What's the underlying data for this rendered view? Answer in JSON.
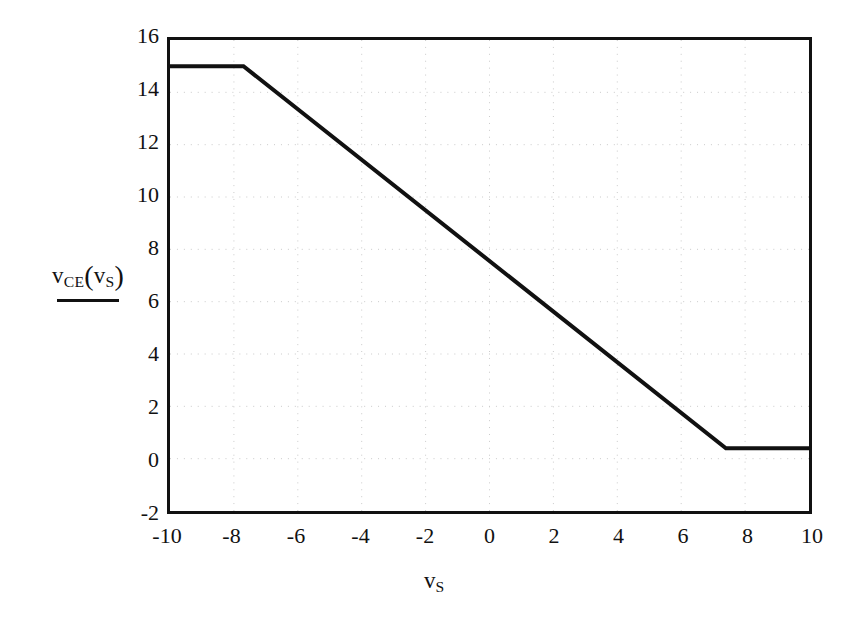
{
  "chart_data": {
    "type": "line",
    "title": "",
    "subtitle": "",
    "xlabel": "v_S",
    "ylabel": "v_CE(v_S)",
    "xlabel_base": "v",
    "xlabel_sub": "S",
    "ylabel_base": "v",
    "ylabel_sub": "CE",
    "ylabel_arg_base": "v",
    "ylabel_arg_sub": "S",
    "xlim": [
      -10,
      10
    ],
    "ylim": [
      -2,
      16
    ],
    "xticks": [
      -10,
      -8,
      -6,
      -4,
      -2,
      0,
      2,
      4,
      6,
      8,
      10
    ],
    "xtick_labels": [
      "-10",
      "-8",
      "-6",
      "-4",
      "-2",
      "0",
      "2",
      "4",
      "6",
      "8",
      "10"
    ],
    "yticks": [
      -2,
      0,
      2,
      4,
      6,
      8,
      10,
      12,
      14,
      16
    ],
    "ytick_labels": [
      "-2",
      "0",
      "2",
      "4",
      "6",
      "8",
      "10",
      "12",
      "14",
      "16"
    ],
    "grid": true,
    "grid_style": "dotted",
    "grid_color": "#c9c9c9",
    "legend": false,
    "legend_position": "none",
    "frame": true,
    "line_color": "#111111",
    "line_width": 4,
    "series": [
      {
        "name": "v_CE(v_S)",
        "x": [
          -10,
          -7.7,
          7.4,
          10
        ],
        "y": [
          15,
          15,
          0.4,
          0.4
        ]
      }
    ],
    "annotations": [
      {
        "text": "cutoff plateau at v_CE = 15 V for v_S below -7.7 V"
      },
      {
        "text": "linear active region with slope about -0.97 V/V between v_S = -7.7 V and v_S = 7.4 V"
      },
      {
        "text": "saturation plateau at v_CE = 0.4 V for v_S above 7.4 V"
      }
    ]
  },
  "axis": {
    "y_legend_label": "v",
    "y_legend_sub": "CE",
    "y_legend_open": "(",
    "y_legend_arg": "v",
    "y_legend_arg_sub": "S",
    "y_legend_close": ")"
  }
}
